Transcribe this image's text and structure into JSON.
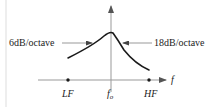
{
  "diagram": {
    "type": "frequency-response-curve",
    "axes": {
      "x_label": "f",
      "x_ticks": [
        {
          "label": "LF",
          "marker": "dot"
        },
        {
          "label": "f",
          "subscript": "o",
          "marker": "axis-intersection"
        },
        {
          "label": "HF",
          "marker": "dot"
        }
      ],
      "y_axis": "vertical arrow at f_o"
    },
    "annotations": [
      {
        "text": "6dB/octave",
        "side": "left",
        "points_to": "rising slope"
      },
      {
        "text": "18dB/octave",
        "side": "right",
        "points_to": "falling slope"
      }
    ],
    "curve": {
      "description": "peaked response: gentle 6dB/octave rise from LF to peak at f_o, steeper 18dB/octave fall toward HF"
    },
    "colors": {
      "line": "#1a1a1a",
      "arrow": "#888888",
      "background": "#ffffff"
    }
  }
}
